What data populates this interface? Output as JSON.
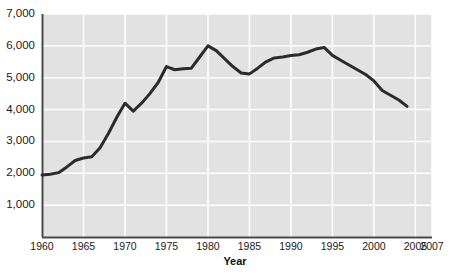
{
  "chart_data": {
    "type": "line",
    "title": "",
    "subtitle": "",
    "xlabel": "Year",
    "ylabel": "",
    "xlim": [
      1960,
      2007
    ],
    "ylim": [
      0,
      7000
    ],
    "grid": true,
    "legend": null,
    "legend_position": "none",
    "x_tick_labels": [
      "1960",
      "1965",
      "1970",
      "1975",
      "1980",
      "1985",
      "1990",
      "1995",
      "2000",
      "2005",
      "2007"
    ],
    "x_tick_values": [
      1960,
      1965,
      1970,
      1975,
      1980,
      1985,
      1990,
      1995,
      2000,
      2005,
      2007
    ],
    "y_tick_labels": [
      "1,000",
      "2,000",
      "3,000",
      "4,000",
      "5,000",
      "6,000",
      "7,000"
    ],
    "y_tick_values": [
      1000,
      2000,
      3000,
      4000,
      5000,
      6000,
      7000
    ],
    "x": [
      1960,
      1961,
      1962,
      1963,
      1964,
      1965,
      1966,
      1967,
      1968,
      1969,
      1970,
      1971,
      1972,
      1973,
      1974,
      1975,
      1976,
      1977,
      1978,
      1979,
      1980,
      1981,
      1982,
      1983,
      1984,
      1985,
      1986,
      1987,
      1988,
      1989,
      1990,
      1991,
      1992,
      1993,
      1994,
      1995,
      1996,
      1997,
      1998,
      1999,
      2000,
      2001,
      2002,
      2003,
      2004
    ],
    "values": [
      1950,
      1970,
      2020,
      2200,
      2400,
      2480,
      2520,
      2800,
      3250,
      3750,
      4200,
      3950,
      4200,
      4500,
      4850,
      5350,
      5250,
      5280,
      5300,
      5650,
      6000,
      5850,
      5600,
      5350,
      5150,
      5120,
      5300,
      5500,
      5620,
      5650,
      5700,
      5720,
      5800,
      5900,
      5950,
      5700,
      5550,
      5400,
      5250,
      5100,
      4900,
      4600,
      4450,
      4300,
      4100
    ],
    "series": [
      {
        "name": "series-1",
        "color": "#2b2b2b",
        "values": [
          1950,
          1970,
          2020,
          2200,
          2400,
          2480,
          2520,
          2800,
          3250,
          3750,
          4200,
          3950,
          4200,
          4500,
          4850,
          5350,
          5250,
          5280,
          5300,
          5650,
          6000,
          5850,
          5600,
          5350,
          5150,
          5120,
          5300,
          5500,
          5620,
          5650,
          5700,
          5720,
          5800,
          5900,
          5950,
          5700,
          5550,
          5400,
          5250,
          5100,
          4900,
          4600,
          4450,
          4300,
          4100
        ]
      }
    ]
  },
  "style": {
    "plot_background": "#e2e2e2",
    "gridline_color": "#ffffff",
    "line_color": "#2b2b2b",
    "axis_color": "#4a4a4a",
    "text_color": "#1a1a1a",
    "page_background": "#ffffff"
  },
  "geometry": {
    "plot_left": 42,
    "plot_right": 432,
    "plot_top": 14,
    "plot_bottom": 237
  }
}
